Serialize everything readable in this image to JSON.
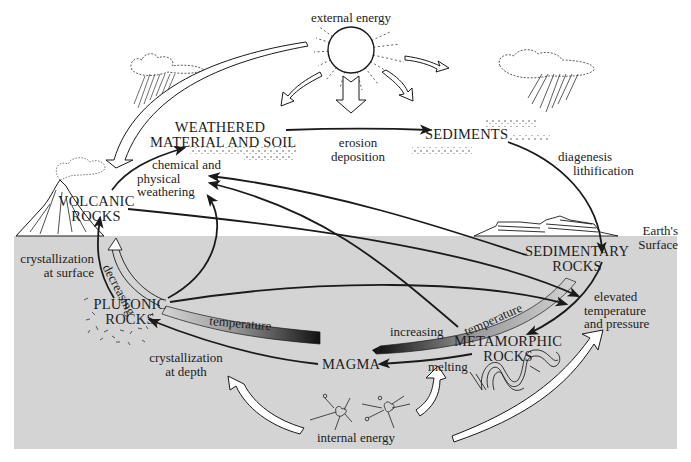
{
  "diagram": {
    "colors": {
      "subsurface": "#d4d4d4",
      "ink": "#1a1a1a",
      "paper": "#ffffff"
    },
    "nodes": {
      "external_energy": "external energy",
      "weathered_1": "WEATHERED",
      "weathered_2": "MATERIAL AND SOIL",
      "sediments": "SEDIMENTS",
      "volcanic_1": "VOLCANIC",
      "volcanic_2": "ROCKS",
      "sedimentary_1": "SEDIMENTARY",
      "sedimentary_2": "ROCKS",
      "plutonic_1": "PLUTONIC",
      "plutonic_2": "ROCKS",
      "metamorphic_1": "METAMORPHIC",
      "metamorphic_2": "ROCKS",
      "magma": "MAGMA",
      "internal_energy": "internal energy",
      "earths_surface_1": "Earth's",
      "earths_surface_2": "Surface"
    },
    "processes": {
      "erosion": "erosion",
      "deposition": "deposition",
      "diagenesis": "diagenesis",
      "lithification": "lithification",
      "weathering_1": "chemical and",
      "weathering_2": "physical",
      "weathering_3": "weathering",
      "cryst_surface_1": "crystallization",
      "cryst_surface_2": "at surface",
      "cryst_depth_1": "crystallization",
      "cryst_depth_2": "at depth",
      "elevated_1": "elevated",
      "elevated_2": "temperature",
      "elevated_3": "and pressure",
      "melting": "melting",
      "decreasing": "decreasing",
      "temperature_left": "temperature",
      "increasing": "increasing",
      "temperature_right": "temperature"
    }
  }
}
